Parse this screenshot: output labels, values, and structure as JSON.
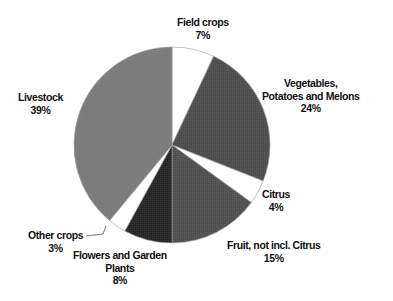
{
  "chart_data": {
    "type": "pie",
    "title": "",
    "start_angle_deg": 0,
    "direction": "clockwise",
    "center": [
      172,
      145
    ],
    "radius": 98,
    "slices": [
      {
        "name": "Field crops",
        "value": 7,
        "label": "7%",
        "color": "#ffffff"
      },
      {
        "name": "Vegetables, Potatoes and Melons",
        "value": 24,
        "label": "24%",
        "color": "#4d4d4d"
      },
      {
        "name": "Citrus",
        "value": 4,
        "label": "4%",
        "color": "#ffffff"
      },
      {
        "name": "Fruit, not incl. Citrus",
        "value": 15,
        "label": "15%",
        "color": "#505050"
      },
      {
        "name": "Flowers and Garden Plants",
        "value": 8,
        "label": "8%",
        "color": "#262626"
      },
      {
        "name": "Other crops",
        "value": 3,
        "label": "3%",
        "color": "#ffffff"
      },
      {
        "name": "Livestock",
        "value": 39,
        "label": "39%",
        "color": "#7a7a7a"
      }
    ],
    "legend": "none (data labels beside slices)"
  },
  "labels": {
    "field_crops": {
      "line1": "Field crops",
      "pct": "7%"
    },
    "vegetables": {
      "line1": "Vegetables,",
      "line2": "Potatoes and Melons",
      "pct": "24%"
    },
    "citrus": {
      "line1": "Citrus",
      "pct": "4%"
    },
    "fruit": {
      "line1": "Fruit, not incl. Citrus",
      "pct": "15%"
    },
    "flowers": {
      "line1": "Flowers and Garden",
      "line2": "Plants",
      "pct": "8%"
    },
    "other": {
      "line1": "Other crops",
      "pct": "3%"
    },
    "livestock": {
      "line1": "Livestock",
      "pct": "39%"
    }
  }
}
